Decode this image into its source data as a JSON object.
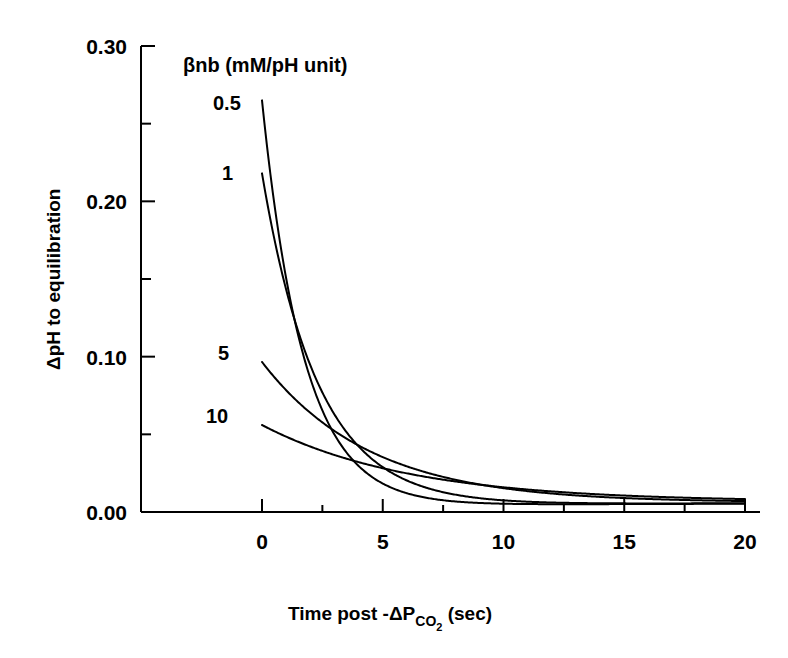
{
  "chart_data": {
    "type": "line",
    "title": "",
    "xlabel": "Time post -ΔP_CO2 (sec)",
    "xlabel_parts": {
      "main": "Time post -ΔP",
      "sub": "CO",
      "subsub": "2",
      "tail": "(sec)"
    },
    "ylabel": "ΔpH to equilibration",
    "xlim": [
      0,
      20
    ],
    "ylim": [
      0.0,
      0.3
    ],
    "grid": false,
    "legend_position": "inside-upper-left",
    "legend_title": "βnb (mM/pH unit)",
    "xticks": [
      0,
      5,
      10,
      15,
      20
    ],
    "xticklabels": [
      "0",
      "5",
      "10",
      "15",
      "20"
    ],
    "x_minor_ticks": [
      2.5,
      7.5,
      12.5,
      17.5
    ],
    "yticks": [
      0.0,
      0.1,
      0.2,
      0.3
    ],
    "yticklabels": [
      "0.00",
      "0.10",
      "0.20",
      "0.30"
    ],
    "y_minor_ticks": [
      0.05,
      0.15,
      0.25
    ],
    "line_color": "#000000",
    "line_width": 2,
    "series": [
      {
        "name": "0.5",
        "label": "0.5",
        "y0": 0.265,
        "tau": 1.75,
        "offset": 0.0,
        "rise": 0.0055,
        "rise_tau": 6.0,
        "x": [
          0,
          0.5,
          1,
          1.5,
          2,
          2.5,
          3,
          4,
          5,
          6,
          7,
          8,
          9,
          10,
          12,
          14,
          16,
          18,
          20
        ],
        "values": [
          0.265,
          0.199,
          0.15,
          0.113,
          0.085,
          0.064,
          0.048,
          0.027,
          0.016,
          0.01,
          0.007,
          0.005,
          0.004,
          0.004,
          0.004,
          0.004,
          0.005,
          0.005,
          0.005
        ]
      },
      {
        "name": "1",
        "label": "1",
        "y0": 0.218,
        "tau": 2.35,
        "offset": 0.0,
        "rise": 0.006,
        "rise_tau": 7.5,
        "x": [
          0,
          0.5,
          1,
          1.5,
          2,
          2.5,
          3,
          4,
          5,
          6,
          7,
          8,
          9,
          10,
          12,
          14,
          16,
          18,
          20
        ],
        "values": [
          0.218,
          0.176,
          0.143,
          0.116,
          0.094,
          0.076,
          0.062,
          0.041,
          0.027,
          0.018,
          0.013,
          0.009,
          0.007,
          0.006,
          0.005,
          0.005,
          0.005,
          0.006,
          0.006
        ]
      },
      {
        "name": "5",
        "label": "5",
        "y0": 0.0966,
        "tau": 4.6,
        "offset": 0.0,
        "rise": 0.0065,
        "rise_tau": 9.0,
        "x": [
          0,
          1,
          2,
          3,
          4,
          5,
          6,
          7,
          8,
          9,
          10,
          12,
          14,
          16,
          18,
          20
        ],
        "values": [
          0.0966,
          0.078,
          0.062,
          0.05,
          0.041,
          0.033,
          0.027,
          0.022,
          0.018,
          0.015,
          0.013,
          0.01,
          0.008,
          0.007,
          0.007,
          0.007
        ]
      },
      {
        "name": "10",
        "label": "10",
        "y0": 0.056,
        "tau": 6.4,
        "offset": 0.0,
        "rise": 0.007,
        "rise_tau": 11.0,
        "x": [
          0,
          1,
          2,
          3,
          4,
          5,
          6,
          7,
          8,
          9,
          10,
          12,
          14,
          16,
          18,
          20
        ],
        "values": [
          0.056,
          0.048,
          0.042,
          0.036,
          0.031,
          0.027,
          0.024,
          0.021,
          0.019,
          0.017,
          0.015,
          0.012,
          0.01,
          0.009,
          0.008,
          0.008
        ]
      }
    ],
    "curve_label_positions": [
      {
        "label": "0.5",
        "x_px": 213,
        "y_px": 110
      },
      {
        "label": "1",
        "x_px": 222,
        "y_px": 180
      },
      {
        "label": "5",
        "x_px": 218,
        "y_px": 360
      },
      {
        "label": "10",
        "x_px": 206,
        "y_px": 423
      }
    ]
  },
  "geometry": {
    "plot_left_px": 141,
    "plot_right_px": 760,
    "plot_top_px": 46,
    "plot_bottom_px": 512,
    "x0_px": 262,
    "x20_px": 745
  }
}
